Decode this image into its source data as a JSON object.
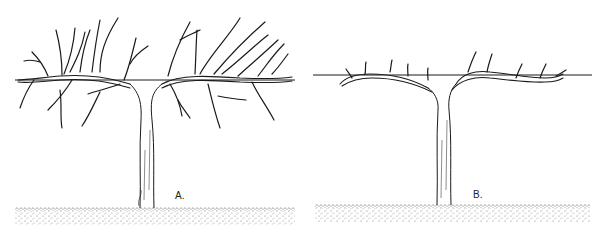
{
  "figure": {
    "panels": [
      {
        "id": "A",
        "label": "A.",
        "description": "Unpruned vine on trellis wire with many long canes",
        "label_pos": {
          "x": 175,
          "y": 190
        },
        "wire": {
          "x1": 15,
          "x2": 295,
          "y": 80
        },
        "ground": {
          "x": 15,
          "y": 207,
          "w": 280,
          "h": 18
        },
        "trunk": {
          "x": 140,
          "top": 85,
          "bottom": 208,
          "width": 14
        }
      },
      {
        "id": "B",
        "label": "B.",
        "description": "Pruned vine with cordon arms along wire bearing short spurs",
        "label_pos": {
          "x": 473,
          "y": 189
        },
        "wire": {
          "x1": 313,
          "x2": 592,
          "y": 75
        },
        "ground": {
          "x": 315,
          "y": 204,
          "w": 275,
          "h": 18
        },
        "trunk": {
          "x": 437,
          "top": 92,
          "bottom": 205,
          "width": 14
        },
        "spur_count": 10
      }
    ],
    "colors": {
      "ink": "#1a1a1a",
      "background": "#ffffff",
      "ground_stipple": "#555555"
    }
  }
}
